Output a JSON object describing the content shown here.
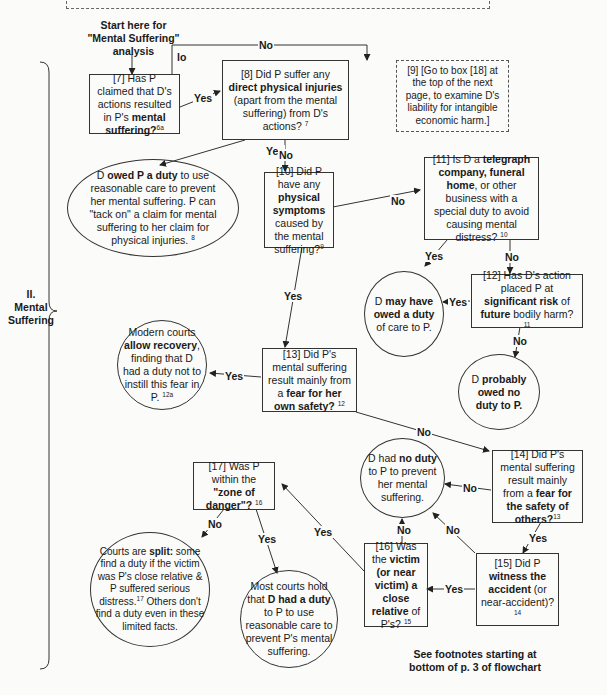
{
  "section": {
    "label_line1": "II.",
    "label_line2": "Mental",
    "label_line3": "Suffering"
  },
  "start": {
    "line1": "Start here for",
    "line2": "\"Mental Suffering\"",
    "line3": "analysis"
  },
  "footer": {
    "line1": "See footnotes starting at",
    "line2": "bottom of p. 3 of flowchart"
  },
  "nodes": {
    "n7": {
      "pre": "[7] Has P claimed that D's actions resulted in P's ",
      "bold": "mental suffering?",
      "post": "",
      "note": "6a"
    },
    "n8": {
      "pre": "[8] Did P suffer any ",
      "bold": "direct physical injuries",
      "post": " (apart from the mental suffering) from D's actions?",
      "note": "7"
    },
    "n9": {
      "text": "[9] [Go to box [18] at the top of the next page, to examine D's liability for intangible economic harm.]"
    },
    "n_owed": {
      "pre": "D ",
      "bold": "owed P a duty",
      "post": " to use reasonable care to prevent her mental suffering. P can \"tack on\" a claim for mental suffering to her claim for physical injuries.",
      "note": "8"
    },
    "n10": {
      "pre": "[10] Did P have any ",
      "bold": "physical symptoms",
      "post": " caused by the mental suffering?",
      "note": "9"
    },
    "n11": {
      "pre": "[11] Is D a ",
      "bold": "telegraph company, funeral home",
      "post": ", or other business with a special duty to avoid causing mental distress?",
      "note": "10"
    },
    "n_may": {
      "pre": "D ",
      "bold": "may have owed a duty",
      "post": " of care to P.",
      "note": ""
    },
    "n12": {
      "pre": "[12] Has D's action placed P at ",
      "bold": "significant risk",
      "post": " of ",
      "bold2": "future",
      "post2": " bodily harm?",
      "note": "11"
    },
    "n_prob": {
      "pre": "D ",
      "bold": "probably owed no duty to P.",
      "post": "",
      "note": ""
    },
    "n_modern": {
      "pre": "Modern courts ",
      "bold": "allow recovery",
      "post": ", finding that D had a duty not to instill this fear in P.",
      "note": "12a"
    },
    "n13": {
      "pre": "[13] Did P's mental suffering result mainly from a ",
      "bold": "fear for her own safety?",
      "post": "",
      "note": "12"
    },
    "n_noduty": {
      "pre": "D had ",
      "bold": "no duty",
      "post": " to P to prevent her mental suffering.",
      "note": ""
    },
    "n14": {
      "pre": "[14] Did P's mental suffering result mainly from a ",
      "bold": "fear for the safety of others?",
      "post": "",
      "note": "13"
    },
    "n17": {
      "pre": "[17] Was P within the ",
      "bold": "\"zone of danger\"?",
      "post": "",
      "note": "16"
    },
    "n16": {
      "pre": "[16] Was the ",
      "bold": "victim (or near victim) a close relative",
      "post": " of P's?",
      "note": "15"
    },
    "n15": {
      "pre": "[15] Did P ",
      "bold": "witness the accident",
      "post": " (or near-accident)?",
      "note": "14"
    },
    "n_split": {
      "pre": "Courts are ",
      "bold": "split:",
      "post": " some find a duty if the victim was P's close relative & P suffered serious distress.",
      "note": "17",
      "post2": " Others don't find a duty even in these limited facts."
    },
    "n_most": {
      "pre": "Most courts hold that ",
      "bold": "D had a duty",
      "post": " to P to use reasonable care to prevent P's mental suffering.",
      "note": ""
    }
  },
  "edges": {
    "e7_9": "No",
    "e7_9_stub": "lo",
    "e7_8": "Yes",
    "e8_owed": "Yes",
    "e8_10": "No",
    "e10_11": "No",
    "e10_13": "Yes",
    "e11_may": "Yes",
    "e11_12": "No",
    "e12_may": "Yes",
    "e12_prob": "No",
    "e13_modern": "Yes",
    "e13_14": "No",
    "e14_noduty": "No",
    "e14_15": "Yes",
    "e15_noduty": "No",
    "e15_16": "Yes",
    "e16_noduty": "No",
    "e16_17": "Yes",
    "e17_split": "No",
    "e17_most": "Yes"
  }
}
